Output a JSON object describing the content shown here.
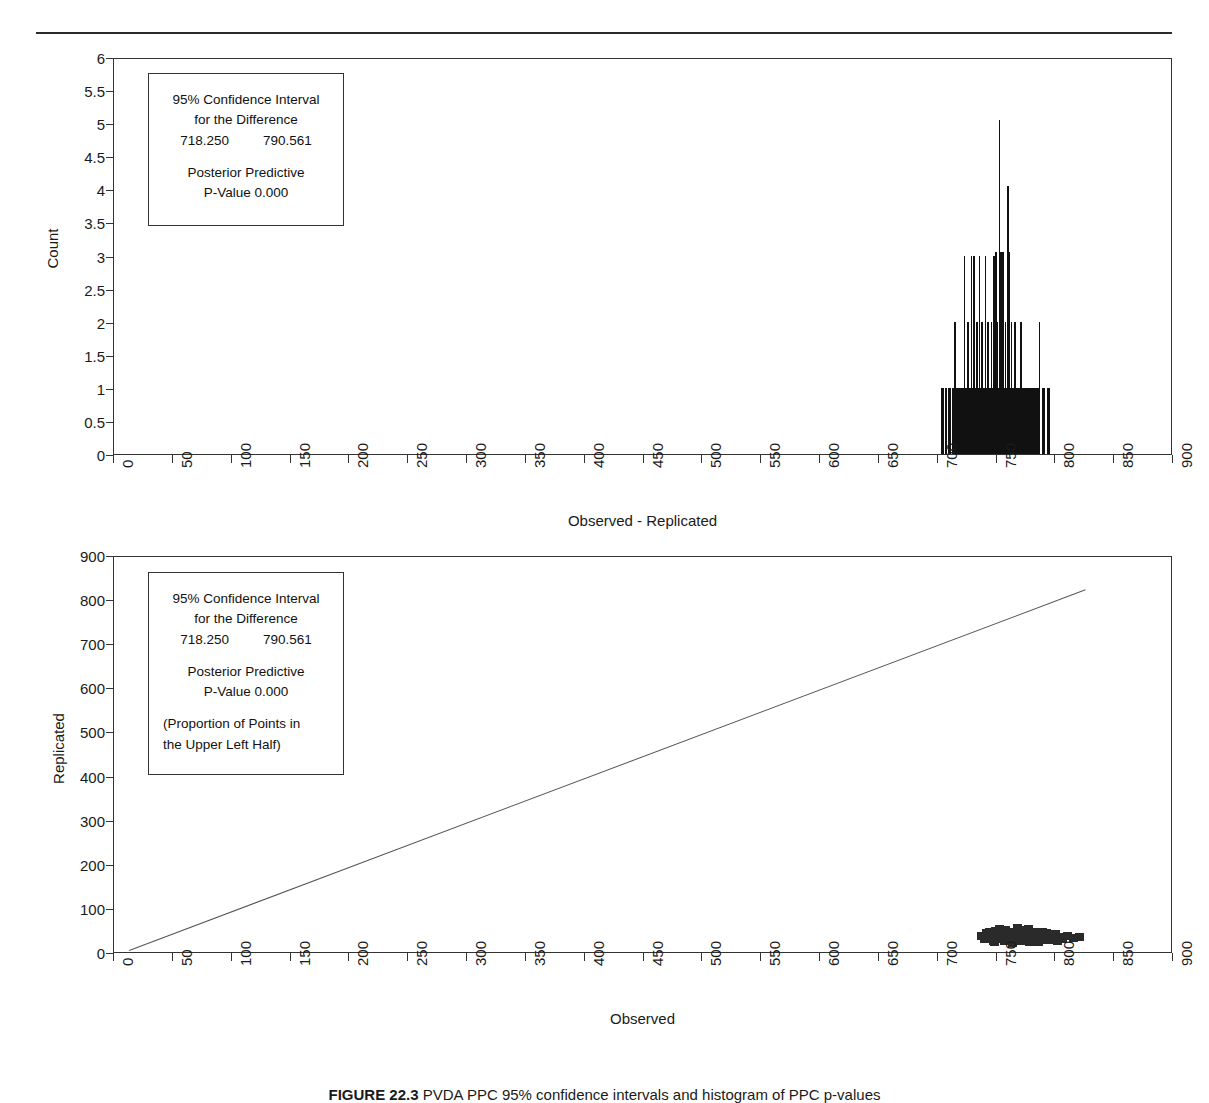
{
  "page": {
    "caption_label": "FIGURE 22.3",
    "caption_text": "PVDA PPC 95% confidence intervals and histogram of PPC p-values"
  },
  "annotation": {
    "ci_title_line1": "95% Confidence Interval",
    "ci_title_line2": "for the Difference",
    "ci_lower": "718.250",
    "ci_upper": "790.561",
    "pp_line1": "Posterior Predictive",
    "pp_line2": "P-Value 0.000",
    "prop_line1": "(Proportion of Points in",
    "prop_line2": "the Upper Left Half)"
  },
  "chart_data": [
    {
      "type": "bar",
      "title": "",
      "xlabel": "Observed - Replicated",
      "ylabel": "Count",
      "xlim": [
        0,
        900
      ],
      "ylim": [
        0,
        6
      ],
      "xticks": [
        0,
        50,
        100,
        150,
        200,
        250,
        300,
        350,
        400,
        450,
        500,
        550,
        600,
        650,
        700,
        750,
        800,
        850,
        900
      ],
      "yticks": [
        0,
        0.5,
        1,
        1.5,
        2,
        2.5,
        3,
        3.5,
        4,
        4.5,
        5,
        5.5,
        6
      ],
      "grid": false,
      "legend": "none",
      "x": [
        703,
        706,
        709,
        712,
        714,
        716,
        718,
        720,
        722,
        723,
        725,
        726,
        728,
        729,
        730,
        732,
        733,
        734,
        735,
        736,
        737,
        738,
        739,
        740,
        741,
        742,
        743,
        744,
        745,
        746,
        747,
        748,
        749,
        750,
        751,
        752,
        753,
        754,
        755,
        756,
        757,
        758,
        759,
        760,
        761,
        762,
        763,
        764,
        765,
        766,
        767,
        768,
        769,
        770,
        771,
        772,
        773,
        774,
        775,
        776,
        778,
        780,
        782,
        784,
        786,
        789,
        793
      ],
      "values": [
        1,
        1,
        1,
        1,
        2,
        1,
        1,
        1,
        3,
        1,
        2,
        1,
        3,
        1,
        3,
        1,
        2,
        1,
        3,
        1,
        2,
        1,
        1,
        3,
        1,
        2,
        1,
        1,
        2,
        1,
        3,
        1,
        3.05,
        2,
        1,
        5.05,
        3.05,
        1,
        3.05,
        1,
        2,
        1,
        4.05,
        3.05,
        1,
        2,
        1,
        1,
        2,
        1,
        1,
        1,
        1,
        2,
        1,
        1,
        1,
        1,
        1,
        1,
        1,
        1,
        1,
        1,
        2,
        1,
        1
      ]
    },
    {
      "type": "scatter",
      "title": "",
      "xlabel": "Observed",
      "ylabel": "Replicated",
      "xlim": [
        0,
        900
      ],
      "ylim": [
        0,
        900
      ],
      "xticks": [
        0,
        50,
        100,
        150,
        200,
        250,
        300,
        350,
        400,
        450,
        500,
        550,
        600,
        650,
        700,
        750,
        800,
        850,
        900
      ],
      "yticks": [
        0,
        100,
        200,
        300,
        400,
        500,
        600,
        700,
        800,
        900
      ],
      "grid": false,
      "legend": "none",
      "reference_line": {
        "x": [
          13,
          826
        ],
        "y": [
          10,
          828
        ]
      },
      "points": [
        [
          737,
          40
        ],
        [
          739,
          33
        ],
        [
          741,
          47
        ],
        [
          743,
          36
        ],
        [
          745,
          44
        ],
        [
          747,
          30
        ],
        [
          749,
          52
        ],
        [
          751,
          38
        ],
        [
          753,
          45
        ],
        [
          755,
          33
        ],
        [
          757,
          55
        ],
        [
          759,
          41
        ],
        [
          760,
          36
        ],
        [
          762,
          50
        ],
        [
          764,
          44
        ],
        [
          765,
          31
        ],
        [
          767,
          58
        ],
        [
          769,
          43
        ],
        [
          770,
          37
        ],
        [
          772,
          52
        ],
        [
          774,
          46
        ],
        [
          775,
          34
        ],
        [
          777,
          56
        ],
        [
          779,
          42
        ],
        [
          780,
          38
        ],
        [
          782,
          49
        ],
        [
          784,
          35
        ],
        [
          786,
          45
        ],
        [
          788,
          40
        ],
        [
          790,
          33
        ],
        [
          792,
          48
        ],
        [
          794,
          37
        ],
        [
          796,
          43
        ],
        [
          798,
          31
        ],
        [
          800,
          46
        ],
        [
          803,
          38
        ],
        [
          806,
          34
        ],
        [
          810,
          41
        ],
        [
          815,
          36
        ],
        [
          820,
          39
        ],
        [
          744,
          50
        ],
        [
          752,
          56
        ],
        [
          758,
          48
        ],
        [
          766,
          51
        ],
        [
          773,
          54
        ],
        [
          781,
          44
        ],
        [
          789,
          50
        ],
        [
          797,
          41
        ],
        [
          748,
          27
        ],
        [
          756,
          29
        ],
        [
          763,
          26
        ],
        [
          771,
          30
        ],
        [
          778,
          28
        ],
        [
          785,
          27
        ],
        [
          793,
          31
        ],
        [
          801,
          29
        ]
      ]
    }
  ]
}
